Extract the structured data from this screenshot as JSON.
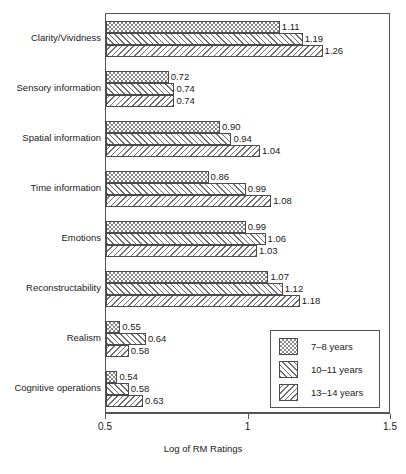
{
  "chart_data": {
    "type": "bar",
    "orientation": "horizontal",
    "title": "",
    "xlabel": "Log of RM Ratings",
    "ylabel": "",
    "xlim": [
      0.5,
      1.5
    ],
    "xticks": [
      "0.5",
      "1",
      "1.5"
    ],
    "xtick_values": [
      0.5,
      1.0,
      1.5
    ],
    "grid": false,
    "legend_position": "bottom-right",
    "bar_value_labels": true,
    "categories": [
      "Clarity/Vividness",
      "Sensory information",
      "Spatial information",
      "Time information",
      "Emotions",
      "Reconstructability",
      "Realism",
      "Cognitive operations"
    ],
    "series": [
      {
        "name": "7–8 years",
        "pattern": "checkerboard",
        "values": [
          1.11,
          0.72,
          0.9,
          0.86,
          0.99,
          1.07,
          0.55,
          0.54
        ],
        "labels": [
          "1.11",
          "0.72",
          "0.90",
          "0.86",
          "0.99",
          "1.07",
          "0.55",
          "0.54"
        ]
      },
      {
        "name": "10–11 years",
        "pattern": "forward-diagonal",
        "values": [
          1.19,
          0.74,
          0.94,
          0.99,
          1.06,
          1.12,
          0.64,
          0.58
        ],
        "labels": [
          "1.19",
          "0.74",
          "0.94",
          "0.99",
          "1.06",
          "1.12",
          "0.64",
          "0.58"
        ]
      },
      {
        "name": "13–14 years",
        "pattern": "back-diagonal",
        "values": [
          1.26,
          0.74,
          1.04,
          1.08,
          1.03,
          1.18,
          0.58,
          0.63
        ],
        "labels": [
          "1.26",
          "0.74",
          "1.04",
          "1.08",
          "1.03",
          "1.18",
          "0.58",
          "0.63"
        ]
      }
    ]
  },
  "colors": {
    "axis": "#555555",
    "bar_border": "#4a4a4a",
    "hatch": "#6f6f6f",
    "text": "#1a1a1a",
    "background": "#ffffff"
  }
}
